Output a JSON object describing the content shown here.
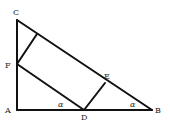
{
  "diagram": {
    "type": "geometry",
    "points": {
      "A": {
        "label": "A",
        "x": 17,
        "y": 110
      },
      "B": {
        "label": "B",
        "x": 152,
        "y": 110
      },
      "C": {
        "label": "C",
        "x": 17,
        "y": 20
      },
      "D": {
        "label": "D",
        "x": 84,
        "y": 110
      },
      "E": {
        "label": "E",
        "x": 105,
        "y": 83
      },
      "F": {
        "label": "F",
        "x": 17,
        "y": 64
      },
      "G": {
        "label": "",
        "x": 37,
        "y": 34
      }
    },
    "segments": [
      [
        "A",
        "C"
      ],
      [
        "A",
        "B"
      ],
      [
        "C",
        "B"
      ],
      [
        "F",
        "D"
      ],
      [
        "D",
        "E"
      ],
      [
        "F",
        "G"
      ]
    ],
    "angle_labels": [
      {
        "symbol": "α",
        "at": "D",
        "x": 58,
        "y": 106
      },
      {
        "symbol": "α",
        "at": "B",
        "x": 130,
        "y": 106
      }
    ],
    "labels": {
      "A": "A",
      "B": "B",
      "C": "C",
      "D": "D",
      "E": "E",
      "F": "F",
      "alpha": "α"
    }
  }
}
